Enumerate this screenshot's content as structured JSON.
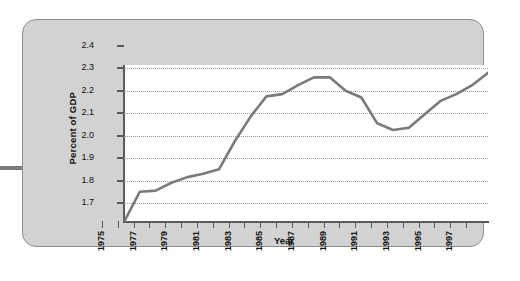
{
  "chart_data": {
    "type": "line",
    "title": "",
    "xlabel": "Year",
    "ylabel": "Percent of GDP",
    "ylim": [
      1.7,
      2.4
    ],
    "xlim": [
      1975,
      1998
    ],
    "grid": true,
    "legend": "none",
    "line_color": "#7a7a7a",
    "y_ticks": [
      "2.4",
      "2.3",
      "2.2",
      "2.1",
      "2.0",
      "1.9",
      "1.8",
      "1.7"
    ],
    "x_tick_labels": [
      "1975",
      "1977",
      "1979",
      "1981",
      "1983",
      "1985",
      "1987",
      "1989",
      "1991",
      "1993",
      "1995",
      "1997"
    ],
    "x": [
      1975,
      1976,
      1977,
      1978,
      1979,
      1980,
      1981,
      1982,
      1983,
      1984,
      1985,
      1986,
      1987,
      1988,
      1989,
      1990,
      1991,
      1992,
      1993,
      1994,
      1995,
      1996,
      1997,
      1998
    ],
    "values": [
      1.7,
      1.835,
      1.84,
      1.875,
      1.9,
      1.915,
      1.935,
      2.06,
      2.17,
      2.26,
      2.27,
      2.31,
      2.345,
      2.345,
      2.285,
      2.255,
      2.14,
      2.11,
      2.12,
      2.18,
      2.24,
      2.27,
      2.31,
      2.365
    ],
    "series": [
      {
        "name": "Percent of GDP",
        "values": [
          1.7,
          1.835,
          1.84,
          1.875,
          1.9,
          1.915,
          1.935,
          2.06,
          2.17,
          2.26,
          2.27,
          2.31,
          2.345,
          2.345,
          2.285,
          2.255,
          2.14,
          2.11,
          2.12,
          2.18,
          2.24,
          2.27,
          2.31,
          2.365
        ]
      }
    ]
  },
  "panel": {
    "background_color": "#d2d2d2",
    "border_color": "#8e8e8e"
  },
  "decor": {
    "left_dash": ""
  }
}
